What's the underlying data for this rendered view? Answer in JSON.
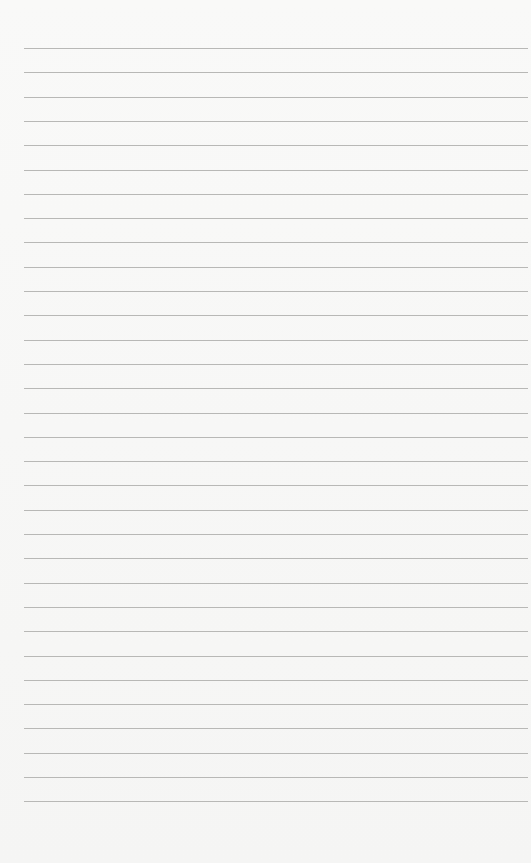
{
  "paper": {
    "background": "#f7f7f6",
    "line_color": "#b8b8b6",
    "line_count": 32,
    "first_line_y": 48,
    "line_spacing": 24.3,
    "line_left": 24,
    "line_right": 528
  }
}
